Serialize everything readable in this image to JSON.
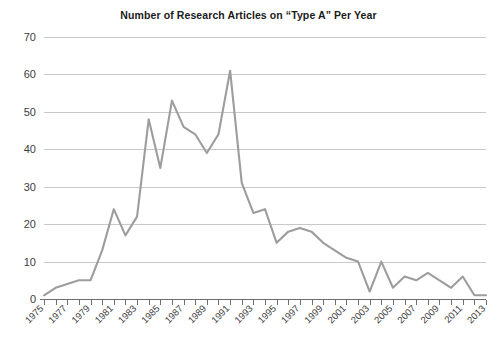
{
  "chart_data": {
    "type": "line",
    "title": "Number of Research Articles on “Type A” Per Year",
    "xlabel": "",
    "ylabel": "",
    "xlim": [
      1975,
      2013
    ],
    "ylim": [
      0,
      70
    ],
    "yticks": [
      0,
      10,
      20,
      30,
      40,
      50,
      60,
      70
    ],
    "ytick_labels": [
      "0",
      "10",
      "20",
      "30",
      "40",
      "50",
      "60",
      "70"
    ],
    "xticks": [
      1975,
      1977,
      1979,
      1981,
      1983,
      1985,
      1987,
      1989,
      1991,
      1993,
      1995,
      1997,
      1999,
      2001,
      2003,
      2005,
      2007,
      2009,
      2011,
      2013
    ],
    "xtick_labels": [
      "1975",
      "1977",
      "1979",
      "1981",
      "1983",
      "1985",
      "1987",
      "1989",
      "1991",
      "1993",
      "1995",
      "1997",
      "1999",
      "2001",
      "2003",
      "2005",
      "2007",
      "2009",
      "2011",
      "2013"
    ],
    "xtick_rotation": -45,
    "grid": "horizontal",
    "legend": "none",
    "line_color": "#9d9d9d",
    "axis_color": "#6f6f6f",
    "grid_color": "#c9c9c9",
    "x": [
      1975,
      1976,
      1977,
      1978,
      1979,
      1980,
      1981,
      1982,
      1983,
      1984,
      1985,
      1986,
      1987,
      1988,
      1989,
      1990,
      1991,
      1992,
      1993,
      1994,
      1995,
      1996,
      1997,
      1998,
      1999,
      2000,
      2001,
      2002,
      2003,
      2004,
      2005,
      2006,
      2007,
      2008,
      2009,
      2010,
      2011,
      2012,
      2013
    ],
    "values": [
      1,
      3,
      4,
      5,
      5,
      13,
      24,
      17,
      22,
      48,
      35,
      53,
      46,
      44,
      39,
      44,
      61,
      31,
      23,
      24,
      15,
      18,
      19,
      18,
      15,
      13,
      11,
      10,
      2,
      10,
      3,
      6,
      5,
      7,
      5,
      3,
      6,
      1,
      1
    ],
    "series": [
      {
        "name": "Research articles per year",
        "values": [
          1,
          3,
          4,
          5,
          5,
          13,
          24,
          17,
          22,
          48,
          35,
          53,
          46,
          44,
          39,
          44,
          61,
          31,
          23,
          24,
          15,
          18,
          19,
          18,
          15,
          13,
          11,
          10,
          2,
          10,
          3,
          6,
          5,
          7,
          5,
          3,
          6,
          1,
          1
        ]
      }
    ],
    "peak": {
      "year": 1991,
      "value": 61
    },
    "annotations": []
  },
  "figure": {
    "background_color": "#ffffff",
    "width": 497,
    "height": 338
  }
}
